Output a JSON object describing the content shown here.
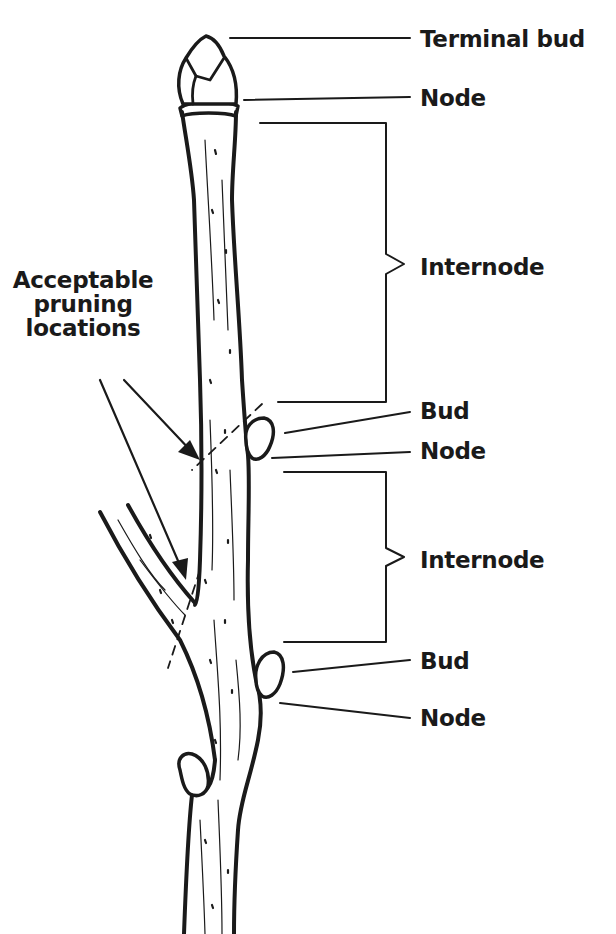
{
  "figure": {
    "colors": {
      "ink": "#1a1a1a",
      "background": "#ffffff"
    }
  },
  "labels": {
    "terminal_bud": "Terminal bud",
    "node_top": "Node",
    "internode_upper": "Internode",
    "bud_upper": "Bud",
    "node_upper": "Node",
    "internode_lower": "Internode",
    "bud_lower": "Bud",
    "node_lower": "Node"
  },
  "callout": {
    "lines": [
      "Acceptable",
      "pruning",
      "locations"
    ]
  }
}
